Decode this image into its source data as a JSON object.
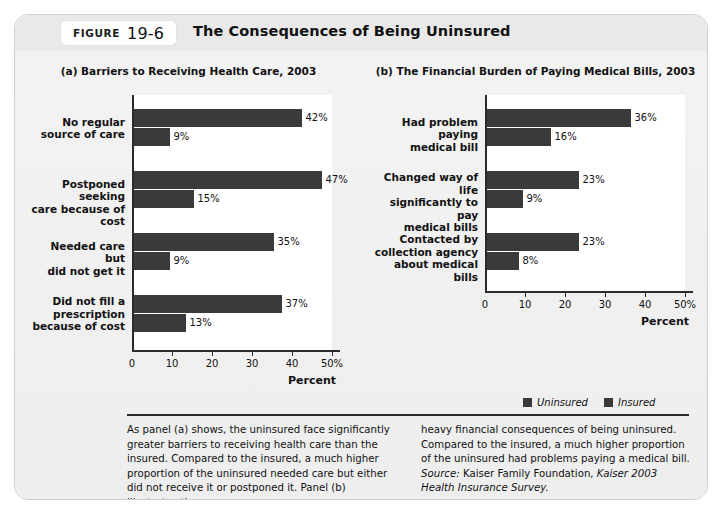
{
  "figure": {
    "label_word": "FIGURE",
    "number": "19-6",
    "title": "The Consequences of Being Uninsured"
  },
  "legend": {
    "items": [
      {
        "label": "Uninsured",
        "color": "#3a3a3a"
      },
      {
        "label": "Insured",
        "color": "#3a3a3a"
      }
    ]
  },
  "caption": {
    "left": "As panel (a) shows, the uninsured face significantly greater barriers to receiving health care than the insured. Compared to the insured, a much higher proportion of the uninsured needed care but either did not receive it or postponed it. Panel (b) illustrates the",
    "right": "heavy financial consequences of being uninsured. Compared to the insured, a much higher proportion of the uninsured had problems paying a medical bill.",
    "source_label": "Source:",
    "source_text": "Kaiser Family Foundation,",
    "source_italic": "Kaiser 2003 Health Insurance Survey."
  },
  "chart_data": [
    {
      "type": "bar",
      "orientation": "horizontal",
      "panel": "(a)",
      "title": "(a) Barriers to Receiving Health Care, 2003",
      "xlabel": "Percent",
      "ylabel": "",
      "xlim": [
        0,
        50
      ],
      "grid": false,
      "legend_position": "below-right-of-panel-b",
      "ticks": [
        0,
        10,
        20,
        30,
        40,
        50
      ],
      "ticklabels": [
        "0",
        "10",
        "20",
        "30",
        "40",
        "50%"
      ],
      "categories": [
        "No regular\nsource of care",
        "Postponed seeking\ncare because of cost",
        "Needed care but\ndid not get it",
        "Did not fill a\nprescription\nbecause of cost"
      ],
      "category_lines": [
        [
          "No regular",
          "source of care"
        ],
        [
          "Postponed seeking",
          "care because of cost"
        ],
        [
          "Needed care but",
          "did not get it"
        ],
        [
          "Did not fill a",
          "prescription",
          "because of cost"
        ]
      ],
      "series": [
        {
          "name": "Uninsured",
          "values": [
            42,
            47,
            35,
            37
          ],
          "labels": [
            "42%",
            "47%",
            "35%",
            "37%"
          ]
        },
        {
          "name": "Insured",
          "values": [
            9,
            15,
            9,
            13
          ],
          "labels": [
            "9%",
            "15%",
            "9%",
            "13%"
          ]
        }
      ]
    },
    {
      "type": "bar",
      "orientation": "horizontal",
      "panel": "(b)",
      "title": "(b) The Financial Burden of Paying Medical Bills, 2003",
      "xlabel": "Percent",
      "ylabel": "",
      "xlim": [
        0,
        50
      ],
      "grid": false,
      "ticks": [
        0,
        10,
        20,
        30,
        40,
        50
      ],
      "ticklabels": [
        "0",
        "10",
        "20",
        "30",
        "40",
        "50%"
      ],
      "categories": [
        "Had problem paying\nmedical bill",
        "Changed way of life\nsignificantly to pay\nmedical bills",
        "Contacted by\ncollection agency\nabout medical bills"
      ],
      "category_lines": [
        [
          "Had problem paying",
          "medical bill"
        ],
        [
          "Changed way of life",
          "significantly to pay",
          "medical bills"
        ],
        [
          "Contacted by",
          "collection agency",
          "about medical bills"
        ]
      ],
      "series": [
        {
          "name": "Uninsured",
          "values": [
            36,
            23,
            23
          ],
          "labels": [
            "36%",
            "23%",
            "23%"
          ]
        },
        {
          "name": "Insured",
          "values": [
            16,
            9,
            8
          ],
          "labels": [
            "16%",
            "9%",
            "8%"
          ]
        }
      ]
    }
  ]
}
